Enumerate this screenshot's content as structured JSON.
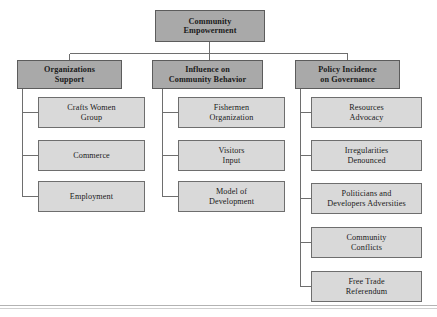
{
  "diagram": {
    "title": "Community Empowerment",
    "type": "organizational-tree",
    "colors": {
      "branch_fill": "#a9a9a9",
      "leaf_fill": "#d9d9d9",
      "border": "#6e6e6e",
      "connector": "#6e6e6e",
      "text": "#1a1a1a",
      "background": "#ffffff"
    },
    "root": {
      "label": "Community\nEmpowerment"
    },
    "branches": [
      {
        "label": "Organizations\nSupport",
        "children": [
          {
            "label": "Crafts Women\nGroup"
          },
          {
            "label": "Commerce"
          },
          {
            "label": "Employment"
          }
        ]
      },
      {
        "label": "Influence on\nCommunity Behavior",
        "children": [
          {
            "label": "Fishermen\nOrganization"
          },
          {
            "label": "Visitors\nInput"
          },
          {
            "label": "Model of\nDevelopment"
          }
        ]
      },
      {
        "label": "Policy Incidence\non Governance",
        "children": [
          {
            "label": "Resources\nAdvocacy"
          },
          {
            "label": "Irregularities\nDenounced"
          },
          {
            "label": "Politicians and\nDevelopers Adversities"
          },
          {
            "label": "Community\nConflicts"
          },
          {
            "label": "Free Trade\nReferendum"
          }
        ]
      }
    ]
  }
}
